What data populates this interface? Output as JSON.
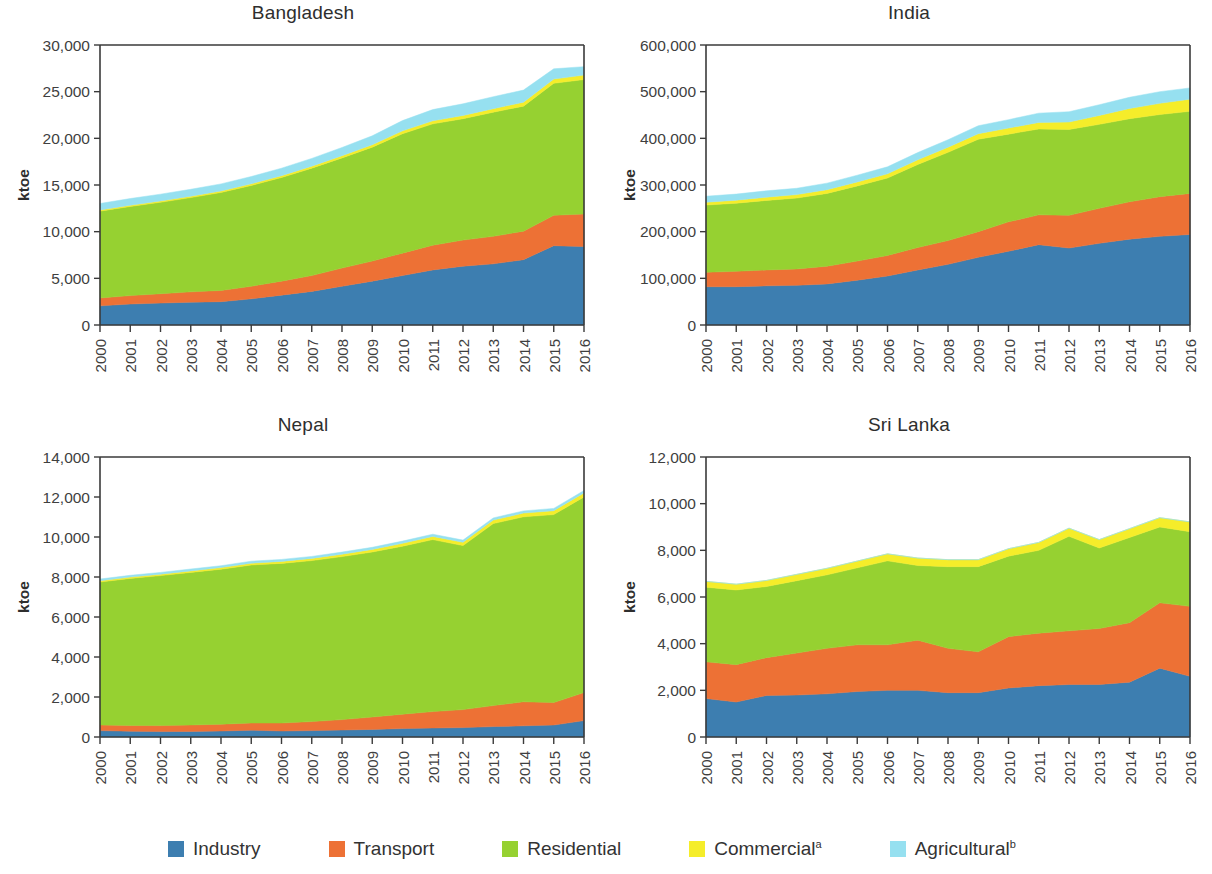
{
  "legend": {
    "items": [
      {
        "label": "Industry",
        "sup": "",
        "color": "#3d7eb0"
      },
      {
        "label": "Transport",
        "sup": "",
        "color": "#ed7135"
      },
      {
        "label": "Residential",
        "sup": "",
        "color": "#96d131"
      },
      {
        "label": "Commercial",
        "sup": "a",
        "color": "#f5ed2a"
      },
      {
        "label": "Agricultural",
        "sup": "b",
        "color": "#96e0f0"
      }
    ]
  },
  "chart_data": [
    {
      "type": "area",
      "title": "Bangladesh",
      "xlabel": "",
      "ylabel": "ktoe",
      "grid": false,
      "stacked": true,
      "legend_position": "bottom",
      "x": [
        2000,
        2001,
        2002,
        2003,
        2004,
        2005,
        2006,
        2007,
        2008,
        2009,
        2010,
        2011,
        2012,
        2013,
        2014,
        2015,
        2016
      ],
      "categories": [
        "2000",
        "2001",
        "2002",
        "2003",
        "2004",
        "2005",
        "2006",
        "2007",
        "2008",
        "2009",
        "2010",
        "2011",
        "2012",
        "2013",
        "2014",
        "2015",
        "2016"
      ],
      "ylim": [
        0,
        30000
      ],
      "yticks": [
        0,
        5000,
        10000,
        15000,
        20000,
        25000,
        30000
      ],
      "ytick_labels": [
        "0",
        "5,000",
        "10,000",
        "15,000",
        "20,000",
        "25,000",
        "30,000"
      ],
      "series": [
        {
          "name": "Industry",
          "color": "#3d7eb0",
          "values": [
            2050,
            2250,
            2350,
            2450,
            2500,
            2800,
            3200,
            3600,
            4150,
            4700,
            5300,
            5900,
            6300,
            6550,
            7000,
            8500,
            8400
          ]
        },
        {
          "name": "Transport",
          "color": "#ed7135",
          "values": [
            850,
            900,
            1000,
            1100,
            1200,
            1350,
            1500,
            1700,
            1950,
            2150,
            2400,
            2650,
            2800,
            2950,
            3050,
            3250,
            3500
          ]
        },
        {
          "name": "Residential",
          "color": "#96d131",
          "values": [
            9300,
            9550,
            9800,
            10100,
            10500,
            10800,
            11100,
            11500,
            11800,
            12200,
            12800,
            13000,
            13000,
            13300,
            13400,
            14150,
            14400
          ]
        },
        {
          "name": "Commercial",
          "color": "#f5ed2a",
          "values": [
            120,
            130,
            140,
            150,
            160,
            180,
            200,
            220,
            240,
            270,
            300,
            330,
            350,
            380,
            420,
            450,
            480
          ]
        },
        {
          "name": "Agricultural",
          "color": "#96e0f0",
          "values": [
            700,
            720,
            730,
            740,
            760,
            780,
            800,
            830,
            880,
            950,
            1100,
            1200,
            1250,
            1280,
            1300,
            1100,
            900
          ]
        }
      ]
    },
    {
      "type": "area",
      "title": "India",
      "xlabel": "",
      "ylabel": "ktoe",
      "grid": false,
      "stacked": true,
      "legend_position": "bottom",
      "x": [
        2000,
        2001,
        2002,
        2003,
        2004,
        2005,
        2006,
        2007,
        2008,
        2009,
        2010,
        2011,
        2012,
        2013,
        2014,
        2015,
        2016
      ],
      "categories": [
        "2000",
        "2001",
        "2002",
        "2003",
        "2004",
        "2005",
        "2006",
        "2007",
        "2008",
        "2009",
        "2010",
        "2011",
        "2012",
        "2013",
        "2014",
        "2015",
        "2016"
      ],
      "ylim": [
        0,
        600000
      ],
      "yticks": [
        0,
        100000,
        200000,
        300000,
        400000,
        500000,
        600000
      ],
      "ytick_labels": [
        "0",
        "100,000",
        "200,000",
        "300,000",
        "400,000",
        "500,000",
        "600,000"
      ],
      "series": [
        {
          "name": "Industry",
          "color": "#3d7eb0",
          "values": [
            82000,
            82000,
            84000,
            85000,
            88000,
            96000,
            105000,
            118000,
            130000,
            145000,
            158000,
            172000,
            165000,
            175000,
            184000,
            190000,
            194000
          ]
        },
        {
          "name": "Transport",
          "color": "#ed7135",
          "values": [
            31000,
            33000,
            34000,
            35000,
            38000,
            41000,
            44000,
            48000,
            51000,
            55000,
            63000,
            64000,
            70000,
            75000,
            80000,
            85000,
            88000
          ]
        },
        {
          "name": "Residential",
          "color": "#96d131",
          "values": [
            144000,
            146000,
            149000,
            152000,
            156000,
            161000,
            166000,
            178000,
            189000,
            198000,
            188000,
            184000,
            184000,
            180000,
            178000,
            176000,
            176000
          ]
        },
        {
          "name": "Commercial",
          "color": "#f5ed2a",
          "values": [
            6000,
            6500,
            7000,
            7500,
            8000,
            8500,
            9000,
            10000,
            11000,
            12000,
            13000,
            14000,
            16000,
            19000,
            22000,
            24000,
            26000
          ]
        },
        {
          "name": "Agricultural",
          "color": "#96e0f0",
          "values": [
            13000,
            13000,
            13500,
            13500,
            14000,
            14500,
            15000,
            15500,
            16000,
            17000,
            18000,
            20000,
            22000,
            23000,
            24000,
            25000,
            24000
          ]
        }
      ]
    },
    {
      "type": "area",
      "title": "Nepal",
      "xlabel": "",
      "ylabel": "ktoe",
      "grid": false,
      "stacked": true,
      "legend_position": "bottom",
      "x": [
        2000,
        2001,
        2002,
        2003,
        2004,
        2005,
        2006,
        2007,
        2008,
        2009,
        2010,
        2011,
        2012,
        2013,
        2014,
        2015,
        2016
      ],
      "categories": [
        "2000",
        "2001",
        "2002",
        "2003",
        "2004",
        "2005",
        "2006",
        "2007",
        "2008",
        "2009",
        "2010",
        "2011",
        "2012",
        "2013",
        "2014",
        "2015",
        "2016"
      ],
      "ylim": [
        0,
        14000
      ],
      "yticks": [
        0,
        2000,
        4000,
        6000,
        8000,
        10000,
        12000,
        14000
      ],
      "ytick_labels": [
        "0",
        "2,000",
        "4,000",
        "6,000",
        "8,000",
        "10,000",
        "12,000",
        "14,000"
      ],
      "series": [
        {
          "name": "Industry",
          "color": "#3d7eb0",
          "values": [
            320,
            290,
            270,
            280,
            300,
            340,
            300,
            320,
            350,
            380,
            420,
            450,
            470,
            520,
            560,
            600,
            820
          ]
        },
        {
          "name": "Transport",
          "color": "#ed7135",
          "values": [
            280,
            290,
            300,
            320,
            340,
            360,
            400,
            450,
            520,
            620,
            720,
            820,
            900,
            1050,
            1200,
            1120,
            1400
          ]
        },
        {
          "name": "Residential",
          "color": "#96d131",
          "values": [
            7150,
            7350,
            7500,
            7630,
            7750,
            7900,
            7980,
            8050,
            8150,
            8250,
            8400,
            8600,
            8200,
            9100,
            9250,
            9400,
            9780
          ]
        },
        {
          "name": "Commercial",
          "color": "#f5ed2a",
          "values": [
            60,
            65,
            70,
            75,
            80,
            90,
            100,
            110,
            120,
            130,
            145,
            160,
            165,
            175,
            185,
            195,
            205
          ]
        },
        {
          "name": "Agricultural",
          "color": "#96e0f0",
          "values": [
            90,
            90,
            90,
            95,
            95,
            100,
            100,
            100,
            105,
            105,
            110,
            110,
            110,
            110,
            110,
            115,
            120
          ]
        }
      ]
    },
    {
      "type": "area",
      "title": "Sri Lanka",
      "xlabel": "",
      "ylabel": "ktoe",
      "grid": false,
      "stacked": true,
      "legend_position": "bottom",
      "x": [
        2000,
        2001,
        2002,
        2003,
        2004,
        2005,
        2006,
        2007,
        2008,
        2009,
        2010,
        2011,
        2012,
        2013,
        2014,
        2015,
        2016
      ],
      "categories": [
        "2000",
        "2001",
        "2002",
        "2003",
        "2004",
        "2005",
        "2006",
        "2007",
        "2008",
        "2009",
        "2010",
        "2011",
        "2012",
        "2013",
        "2014",
        "2015",
        "2016"
      ],
      "ylim": [
        0,
        12000
      ],
      "yticks": [
        0,
        2000,
        4000,
        6000,
        8000,
        10000,
        12000
      ],
      "ytick_labels": [
        "0",
        "2,000",
        "4,000",
        "6,000",
        "8,000",
        "10,000",
        "12,000"
      ],
      "series": [
        {
          "name": "Industry",
          "color": "#3d7eb0",
          "values": [
            1650,
            1500,
            1780,
            1800,
            1850,
            1950,
            2000,
            2000,
            1900,
            1900,
            2100,
            2200,
            2250,
            2250,
            2350,
            2950,
            2600
          ]
        },
        {
          "name": "Transport",
          "color": "#ed7135",
          "values": [
            1570,
            1600,
            1620,
            1800,
            1950,
            2000,
            1950,
            2150,
            1900,
            1750,
            2200,
            2250,
            2300,
            2400,
            2550,
            2800,
            3000
          ]
        },
        {
          "name": "Residential",
          "color": "#96d131",
          "values": [
            3200,
            3200,
            3050,
            3100,
            3150,
            3300,
            3600,
            3200,
            3500,
            3650,
            3450,
            3550,
            4050,
            3450,
            3650,
            3250,
            3200
          ]
        },
        {
          "name": "Commercial",
          "color": "#f5ed2a",
          "values": [
            250,
            250,
            260,
            270,
            280,
            290,
            300,
            320,
            300,
            300,
            320,
            340,
            350,
            360,
            380,
            400,
            420
          ]
        },
        {
          "name": "Agricultural",
          "color": "#96e0f0",
          "values": [
            0,
            0,
            0,
            0,
            0,
            0,
            0,
            0,
            0,
            0,
            0,
            0,
            0,
            0,
            0,
            0,
            0
          ]
        }
      ]
    }
  ]
}
